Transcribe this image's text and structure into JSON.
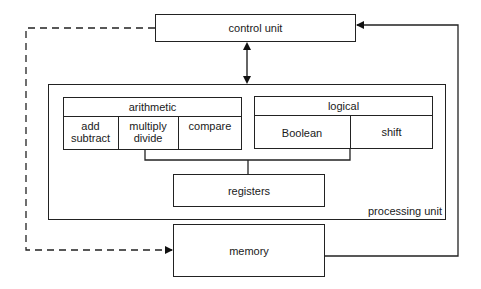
{
  "diagram": {
    "type": "computer-architecture block diagram",
    "nodes": {
      "control_unit": "control unit",
      "processing_unit": "processing unit",
      "arithmetic": {
        "title": "arithmetic",
        "cells": [
          "add\nsubtract",
          "multiply\ndivide",
          "compare"
        ],
        "cell_lines": [
          [
            "add",
            "subtract"
          ],
          [
            "multiply",
            "divide"
          ],
          [
            "compare"
          ]
        ]
      },
      "logical": {
        "title": "logical",
        "cells": [
          "Boolean",
          "shift"
        ]
      },
      "registers": "registers",
      "memory": "memory"
    },
    "edges": [
      {
        "from": "control_unit",
        "to": "processing_unit",
        "style": "solid",
        "direction": "bidirectional"
      },
      {
        "from": "control_unit",
        "to": "memory",
        "style": "dashed",
        "direction": "forward"
      },
      {
        "from": "memory",
        "to": "control_unit",
        "style": "solid",
        "direction": "forward"
      },
      {
        "from": "arithmetic",
        "to": "registers",
        "style": "solid",
        "direction": "none"
      },
      {
        "from": "logical",
        "to": "registers",
        "style": "solid",
        "direction": "none"
      }
    ]
  }
}
